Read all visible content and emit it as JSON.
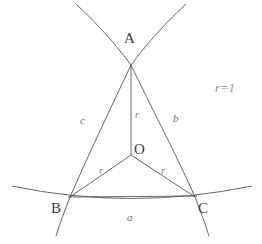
{
  "figure": {
    "background_color": "#ffffff",
    "stroke_color": "#555555",
    "label_color": "#3a3a3a",
    "annotation": {
      "text": "r=1",
      "x": 215,
      "y": 82
    },
    "vertices": [
      {
        "name": "A",
        "label": "A",
        "x": 131,
        "y": 65,
        "label_x": 124,
        "label_y": 31
      },
      {
        "name": "B",
        "label": "B",
        "x": 70,
        "y": 197,
        "label_x": 51,
        "label_y": 201
      },
      {
        "name": "C",
        "label": "C",
        "x": 195,
        "y": 197,
        "label_x": 198,
        "label_y": 201
      },
      {
        "name": "O",
        "label": "O",
        "x": 131,
        "y": 155,
        "label_x": 134,
        "label_y": 142
      }
    ],
    "sides": [
      {
        "name": "side-a",
        "label": "a",
        "opposite_vertex": "A",
        "endpoints": [
          "B",
          "C"
        ],
        "label_x": 127,
        "label_y": 212
      },
      {
        "name": "side-b",
        "label": "b",
        "opposite_vertex": "B",
        "endpoints": [
          "A",
          "C"
        ],
        "label_x": 173,
        "label_y": 113
      },
      {
        "name": "side-c",
        "label": "c",
        "opposite_vertex": "C",
        "endpoints": [
          "A",
          "B"
        ],
        "label_x": 80,
        "label_y": 115
      }
    ],
    "radii": [
      {
        "name": "radius-OA",
        "label": "r",
        "from": "O",
        "to": "A",
        "label_x": 135,
        "label_y": 110
      },
      {
        "name": "radius-OB",
        "label": "r",
        "from": "O",
        "to": "B",
        "label_x": 99,
        "label_y": 166
      },
      {
        "name": "radius-OC",
        "label": "r",
        "from": "O",
        "to": "C",
        "label_x": 161,
        "label_y": 166
      }
    ],
    "arcs": [
      {
        "name": "arc-a-bottom",
        "description": "arc through B and C, bulging downward",
        "path": "M 12 186 Q 131 212 252 186"
      },
      {
        "name": "arc-c-left",
        "description": "arc from upper-right down through A and B and beyond",
        "path": "M 186 5 Q 140 52 131 65 Q 100 130 70 197 Q 62 216 57 235"
      },
      {
        "name": "arc-b-right",
        "description": "arc from upper-left down through A and C and beyond",
        "path": "M 76 5 Q 122 52 131 65 Q 163 130 195 197 Q 203 216 208 235"
      }
    ]
  }
}
